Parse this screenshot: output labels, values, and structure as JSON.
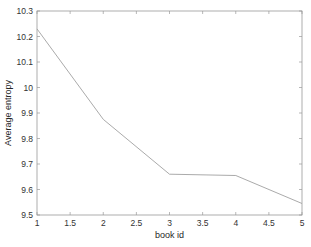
{
  "chart_data": {
    "type": "line",
    "title": "",
    "xlabel": "book id",
    "ylabel": "Average entropy",
    "x": [
      1,
      2,
      3,
      4,
      5
    ],
    "series": [
      {
        "name": "Average entropy",
        "values": [
          10.23,
          9.875,
          9.66,
          9.655,
          9.545
        ],
        "color": "#a0a0a0"
      }
    ],
    "xlim": [
      1,
      5
    ],
    "ylim": [
      9.5,
      10.3
    ],
    "xticks": [
      "1",
      "1.5",
      "2",
      "2.5",
      "3",
      "3.5",
      "4",
      "4.5",
      "5"
    ],
    "yticks": [
      "9.5",
      "9.6",
      "9.7",
      "9.8",
      "9.9",
      "10",
      "10.1",
      "10.2",
      "10.3"
    ],
    "grid": false,
    "legend": null
  }
}
